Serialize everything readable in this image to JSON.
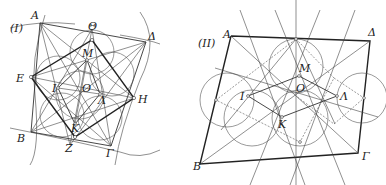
{
  "figure": {
    "panels": [
      {
        "id": "panel-1",
        "tag": "(I)",
        "labels": {
          "A": "A",
          "Theta": "Θ",
          "Delta": "Δ",
          "E": "E",
          "H": "H",
          "B": "B",
          "Z": "Z",
          "Gamma": "Γ",
          "M": "M",
          "O": "O",
          "I": "I",
          "Lambda": "Λ",
          "K": "K"
        }
      },
      {
        "id": "panel-2",
        "tag": "(II)",
        "labels": {
          "A": "A",
          "Delta": "Δ",
          "B": "B",
          "Gamma": "Γ",
          "M": "M",
          "O": "O",
          "I": "I",
          "Lambda": "Λ",
          "K": "K"
        }
      }
    ],
    "colors": {
      "line": "#222222",
      "background": "#ffffff"
    }
  }
}
